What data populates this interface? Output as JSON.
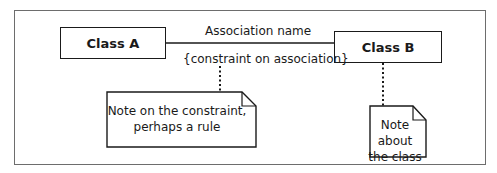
{
  "diagram": {
    "type": "UML class diagram",
    "classes": [
      {
        "name": "Class A"
      },
      {
        "name": "Class B"
      }
    ],
    "association": {
      "name": "Association name",
      "constraint": "{constraint on association}"
    },
    "notes": [
      {
        "line1": "Note on the constraint,",
        "line2": "perhaps a rule",
        "attached_to": "constraint"
      },
      {
        "line1": "Note about",
        "line2": "the class",
        "attached_to": "Class B"
      }
    ]
  }
}
